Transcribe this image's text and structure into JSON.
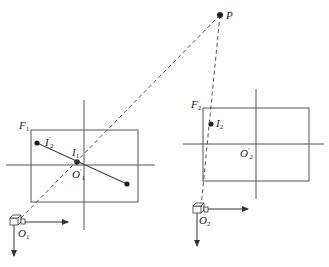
{
  "diagram": {
    "type": "stereo-camera-projection",
    "colors": {
      "line": "#555555",
      "dashed": "#555555",
      "dot": "#222222",
      "text": "#222222"
    },
    "point": {
      "label": "P"
    },
    "frame1": {
      "label": "F",
      "label_sub": "1",
      "center_label": "O",
      "center_sub": "1",
      "center_sup": "′",
      "point_label": "I",
      "point_sub": "1",
      "line_end_label": "I",
      "line_end_sub": "2",
      "line_end_sup": "′"
    },
    "frame2": {
      "label": "F",
      "label_sub": "2",
      "center_label": "O",
      "center_sub": "2",
      "center_sup": "′",
      "point_label": "I",
      "point_sub": "2"
    },
    "camera1": {
      "label": "O",
      "label_sub": "1"
    },
    "camera2": {
      "label": "O",
      "label_sub": "2"
    }
  }
}
